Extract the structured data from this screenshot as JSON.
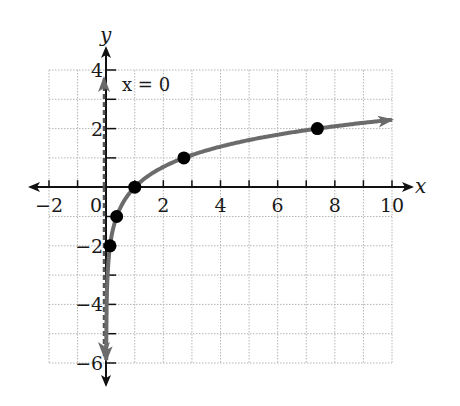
{
  "chart_data": {
    "type": "line",
    "title": "",
    "function": "y = ln x",
    "xlabel": "x",
    "ylabel": "y",
    "xlim": [
      -2,
      10
    ],
    "ylim": [
      -6,
      4
    ],
    "grid": true,
    "x_ticks": [
      -2,
      0,
      2,
      4,
      6,
      8,
      10
    ],
    "y_ticks": [
      4,
      2,
      -2,
      -4,
      -6
    ],
    "x_tick_labels": [
      "−2",
      "0",
      "2",
      "4",
      "6",
      "8",
      "10"
    ],
    "y_tick_labels": [
      "4",
      "2",
      "−2",
      "−4",
      "−6"
    ],
    "asymptote": {
      "label": "x = 0",
      "x": 0,
      "style": "dashed"
    },
    "points": [
      {
        "x": 0.135,
        "y": -2
      },
      {
        "x": 0.368,
        "y": -1
      },
      {
        "x": 1,
        "y": 0
      },
      {
        "x": 2.718,
        "y": 1
      },
      {
        "x": 7.389,
        "y": 2
      }
    ],
    "curve_color": "#6b6b6b",
    "point_color": "#000000"
  }
}
